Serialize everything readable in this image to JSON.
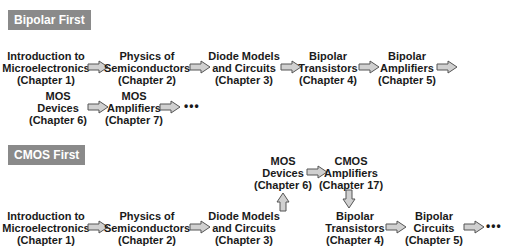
{
  "bipolar_first": {
    "title": "Bipolar First",
    "row1": [
      {
        "line1": "Introduction to",
        "line2": "Microelectronics",
        "line3": "(Chapter 1)"
      },
      {
        "line1": "Physics of",
        "line2": "Semiconductors",
        "line3": "(Chapter 2)"
      },
      {
        "line1": "Diode Models",
        "line2": "and Circuits",
        "line3": "(Chapter 3)"
      },
      {
        "line1": "Bipolar",
        "line2": "Transistors",
        "line3": "(Chapter 4)"
      },
      {
        "line1": "Bipolar",
        "line2": "Amplifiers",
        "line3": "(Chapter 5)"
      }
    ],
    "row2": [
      {
        "line1": "MOS",
        "line2": "Devices",
        "line3": "(Chapter 6)"
      },
      {
        "line1": "MOS",
        "line2": "Amplifiers",
        "line3": "(Chapter 7)"
      }
    ],
    "ellipsis": "•••"
  },
  "cmos_first": {
    "title": "CMOS First",
    "row_top": [
      {
        "line1": "MOS",
        "line2": "Devices",
        "line3": "(Chapter 6)"
      },
      {
        "line1": "CMOS",
        "line2": "Amplifiers",
        "line3": "(Chapter 17)"
      }
    ],
    "row_bottom": [
      {
        "line1": "Introduction to",
        "line2": "Microelectronics",
        "line3": "(Chapter 1)"
      },
      {
        "line1": "Physics of",
        "line2": "Semiconductors",
        "line3": "(Chapter 2)"
      },
      {
        "line1": "Diode Models",
        "line2": "and Circuits",
        "line3": "(Chapter 3)"
      },
      {
        "line1": "Bipolar",
        "line2": "Transistors",
        "line3": "(Chapter 4)"
      },
      {
        "line1": "Bipolar",
        "line2": "Circuits",
        "line3": "(Chapter 5)"
      }
    ],
    "ellipsis": "•••"
  },
  "colors": {
    "badge_bg": "#8a8a8a",
    "arrow_fill": "#d0d0d0",
    "arrow_stroke": "#555555"
  }
}
